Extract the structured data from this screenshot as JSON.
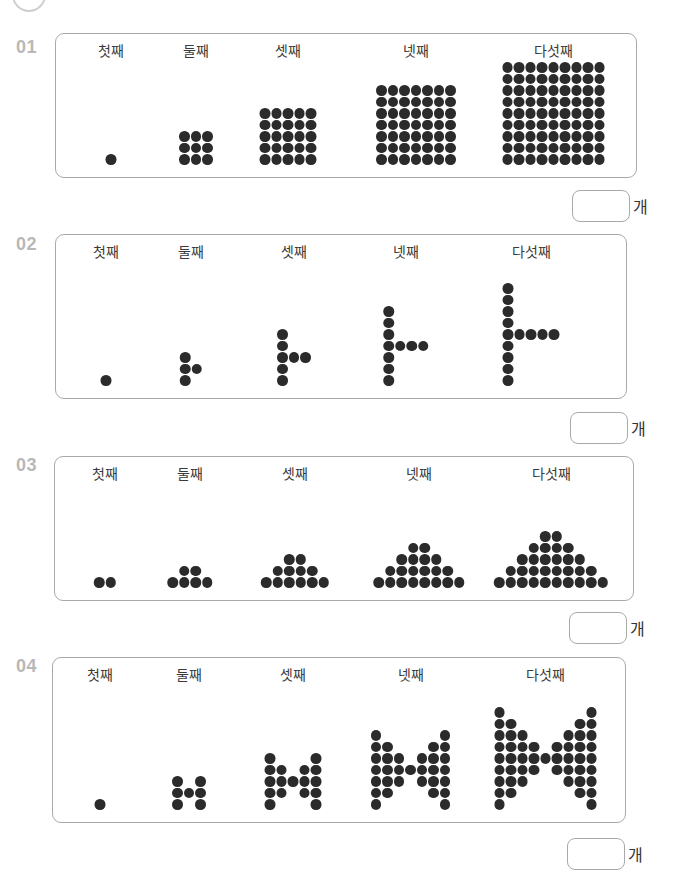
{
  "page": {
    "accent_color": "#b8b8b8",
    "dot_color": "#2b2b2b"
  },
  "labels": [
    "첫째",
    "둘째",
    "셋째",
    "넷째",
    "다섯째"
  ],
  "answer_unit": "개",
  "problems": [
    {
      "number": "01",
      "pattern": "square-grid",
      "dot_counts": [
        1,
        9,
        25,
        49,
        81
      ],
      "figures": [
        {
          "label": "첫째",
          "description": "1x1 grid"
        },
        {
          "label": "둘째",
          "description": "3x3 grid"
        },
        {
          "label": "셋째",
          "description": "5x5 grid"
        },
        {
          "label": "넷째",
          "description": "7x7 grid"
        },
        {
          "label": "다섯째",
          "description": "9x9 grid"
        }
      ],
      "answer_value": ""
    },
    {
      "number": "02",
      "pattern": "vertical-column-with-arm",
      "dot_counts": [
        1,
        4,
        7,
        10,
        13
      ],
      "figures": [
        {
          "label": "첫째",
          "column": 1,
          "arm": 0
        },
        {
          "label": "둘째",
          "column": 3,
          "arm": 1
        },
        {
          "label": "셋째",
          "column": 5,
          "arm": 2
        },
        {
          "label": "넷째",
          "column": 7,
          "arm": 3
        },
        {
          "label": "다섯째",
          "column": 9,
          "arm": 4
        }
      ],
      "answer_value": ""
    },
    {
      "number": "03",
      "pattern": "pyramid",
      "dot_counts": [
        2,
        6,
        12,
        20,
        30
      ],
      "figures": [
        {
          "label": "첫째",
          "rows_bottom_up": [
            2
          ]
        },
        {
          "label": "둘째",
          "rows_bottom_up": [
            4,
            2
          ]
        },
        {
          "label": "셋째",
          "rows_bottom_up": [
            6,
            4,
            2
          ]
        },
        {
          "label": "넷째",
          "rows_bottom_up": [
            8,
            6,
            4,
            2
          ]
        },
        {
          "label": "다섯째",
          "rows_bottom_up": [
            10,
            8,
            6,
            4,
            2
          ]
        }
      ],
      "answer_value": ""
    },
    {
      "number": "04",
      "pattern": "bowtie",
      "dot_counts": [
        1,
        7,
        19,
        37,
        61
      ],
      "figures": [
        {
          "label": "첫째",
          "column_heights": [
            1
          ]
        },
        {
          "label": "둘째",
          "column_heights": [
            3,
            1,
            3
          ]
        },
        {
          "label": "셋째",
          "column_heights": [
            5,
            3,
            1,
            3,
            5
          ]
        },
        {
          "label": "넷째",
          "column_heights": [
            7,
            5,
            3,
            1,
            3,
            5,
            7
          ]
        },
        {
          "label": "다섯째",
          "column_heights": [
            9,
            7,
            5,
            3,
            1,
            3,
            5,
            7,
            9
          ]
        }
      ],
      "answer_value": ""
    }
  ]
}
